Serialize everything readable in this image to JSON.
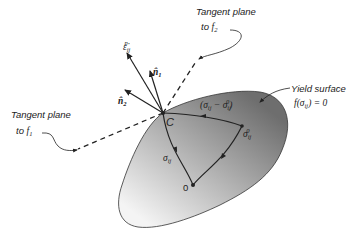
{
  "labels": {
    "tangent_f2_line1": "Tangent plane",
    "tangent_f2_line2": "to ",
    "tangent_f2_f": "f",
    "tangent_f2_sub": "2",
    "tangent_f1_line1": "Tangent plane",
    "tangent_f1_line2": "to ",
    "tangent_f1_f": "f",
    "tangent_f1_sub": "1",
    "yield_line1": "Yield surface",
    "yield_eq_f": "f",
    "yield_eq_open": "(",
    "yield_eq_sigma": "σ",
    "yield_eq_sub": "ij",
    "yield_eq_close": ") = 0",
    "strain_rate": "ε̇",
    "strain_rate_sub": "ij",
    "strain_rate_sup": "p",
    "n1": "n̂",
    "n1_sub": "1",
    "n2": "n̂",
    "n2_sub": "2",
    "point_c": "C",
    "point_origin": "0",
    "sigma": "σ",
    "sigma_sub": "ij",
    "sigma0": "σ",
    "sigma0_sub": "ij",
    "sigma0_sup": "0",
    "diff_open": "(σ",
    "diff_sub1": "ij",
    "diff_minus": " − σ",
    "diff_sub2": "ij",
    "diff_sup2": "0",
    "diff_close": ")"
  },
  "colors": {
    "surface_dark": "#7a7a7a",
    "surface_light": "#f2f2f2",
    "stroke": "#222222"
  }
}
